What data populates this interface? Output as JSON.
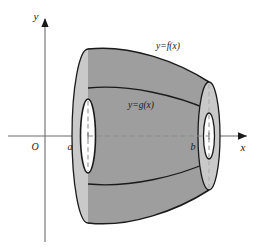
{
  "figure": {
    "type": "solid-of-revolution-washer-diagram",
    "axes": {
      "x_axis_label": "x",
      "y_axis_label": "y",
      "origin_label": "O",
      "x_axis_y_px": 136,
      "y_axis_x_px": 45,
      "x_axis_arrow_x_px": 247,
      "y_axis_arrow_y_px": 18
    },
    "bounds": {
      "lower_limit_label": "a",
      "upper_limit_label": "b",
      "a_x_px": 88,
      "b_x_px": 209
    },
    "curves": [
      {
        "id": "outer",
        "label": "y=f(x)",
        "label_x_px": 168,
        "label_y_px": 49
      },
      {
        "id": "inner",
        "label": "y=g(x)",
        "label_x_px": 141,
        "label_y_px": 108
      }
    ],
    "colors": {
      "body_gray": "#9e9e9e",
      "cap_light_gray": "#c9c9c9",
      "hole_white": "#ffffff",
      "outline": "#1a1a1a",
      "axis_line": "#6b6b6b",
      "dash_line": "#8c8c8c",
      "background": "#ffffff"
    },
    "left_cap": {
      "center_x_px": 88,
      "center_y_px": 136,
      "outer_rx_px": 16,
      "outer_ry_px": 87,
      "inner_rx_px": 7.5,
      "inner_ry_px": 37
    },
    "right_cap": {
      "center_x_px": 209,
      "center_y_px": 136,
      "outer_rx_px": 11,
      "outer_ry_px": 54,
      "inner_rx_px": 5.5,
      "inner_ry_px": 23
    }
  }
}
